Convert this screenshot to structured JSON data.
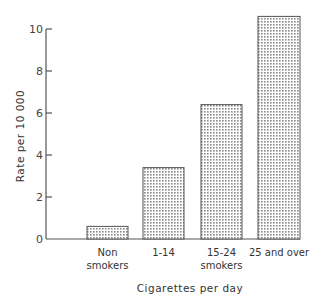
{
  "chart_data": {
    "type": "bar",
    "title": "",
    "xlabel": "Cigarettes per day",
    "ylabel": "Rate per 10 000",
    "categories": [
      "Non smokers",
      "1-14",
      "15-24 smokers",
      "25 and over"
    ],
    "category_lines": [
      [
        "Non",
        "smokers"
      ],
      [
        "1-14"
      ],
      [
        "15-24",
        "smokers"
      ],
      [
        "25 and over"
      ]
    ],
    "values": [
      0.6,
      3.4,
      6.4,
      10.6
    ],
    "ylim": [
      0,
      10.6
    ],
    "yticks": [
      0,
      2,
      4,
      6,
      8,
      10
    ],
    "grid": false,
    "legend": null,
    "fill": "dotted grey pattern"
  },
  "colors": {
    "axis": "#555555",
    "bar_dot": "#8a8a8a",
    "text": "#333333"
  }
}
